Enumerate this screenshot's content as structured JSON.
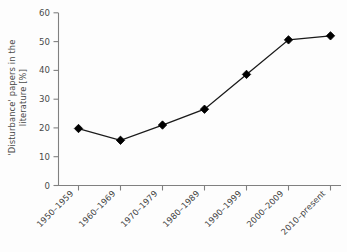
{
  "chart_data": {
    "type": "line",
    "title": "",
    "xlabel": "",
    "ylabel": "'Disturbance' papers in the literature [%]",
    "ylabel_line1": "'Disturbance' papers in the",
    "ylabel_line2": "literature [%]",
    "categories": [
      "1950–1959",
      "1960–1969",
      "1970–1979",
      "1980–1989",
      "1990–1999",
      "2000–2009",
      "2010–present"
    ],
    "values": [
      19.8,
      15.7,
      21.0,
      26.5,
      38.6,
      50.6,
      52.0
    ],
    "ylim": [
      0,
      60
    ],
    "yticks": [
      0,
      10,
      20,
      30,
      40,
      50,
      60
    ],
    "ytick_labels": [
      "0",
      "10",
      "20",
      "30",
      "40",
      "50",
      "60"
    ],
    "grid": false,
    "legend": null,
    "marker": "diamond",
    "series": [
      {
        "name": "'Disturbance' papers",
        "values": [
          19.8,
          15.7,
          21.0,
          26.5,
          38.6,
          50.6,
          52.0
        ]
      }
    ],
    "colors": {
      "line": "#1a1a1a",
      "marker": "#000000",
      "axis": "#808080",
      "tick_label": "#4a4a4a",
      "background": "#fdfdfd"
    }
  },
  "axis": {
    "y_tick_0": "0",
    "y_tick_1": "10",
    "y_tick_2": "20",
    "y_tick_3": "30",
    "y_tick_4": "40",
    "y_tick_5": "50",
    "y_tick_6": "60",
    "x_tick_0": "1950–1959",
    "x_tick_1": "1960–1969",
    "x_tick_2": "1970–1979",
    "x_tick_3": "1980–1989",
    "x_tick_4": "1990–1999",
    "x_tick_5": "2000–2009",
    "x_tick_6": "2010–present"
  }
}
